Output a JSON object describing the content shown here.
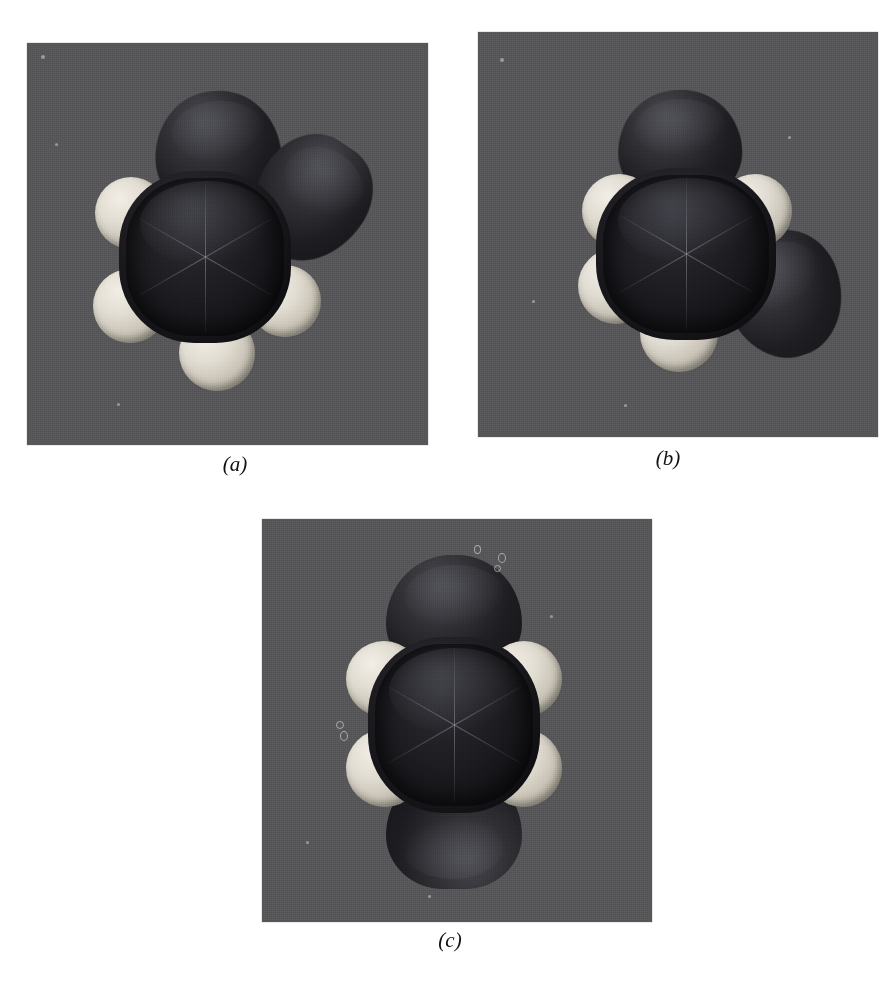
{
  "figure": {
    "type": "photographic-figure",
    "page_background": "#ffffff",
    "panel_background": "#57575a",
    "panel_count": 3,
    "panels": [
      {
        "id": "a",
        "caption": "(a)",
        "orbital_lobes": 2,
        "lobe_positions": [
          "top",
          "upper-right"
        ],
        "hydrogen_spheres": 4,
        "hydrogen_positions": [
          "upper-left",
          "lower-left",
          "bottom",
          "lower-right"
        ],
        "core": "hexagonal carbon ring"
      },
      {
        "id": "b",
        "caption": "(b)",
        "orbital_lobes": 2,
        "lobe_positions": [
          "top",
          "lower-right"
        ],
        "hydrogen_spheres": 4,
        "hydrogen_positions": [
          "upper-left",
          "upper-right",
          "lower-left",
          "bottom"
        ],
        "core": "hexagonal carbon ring"
      },
      {
        "id": "c",
        "caption": "(c)",
        "orbital_lobes": 2,
        "lobe_positions": [
          "top",
          "bottom"
        ],
        "hydrogen_spheres": 4,
        "hydrogen_positions": [
          "upper-left",
          "upper-right",
          "lower-left",
          "lower-right"
        ],
        "core": "hexagonal carbon ring"
      }
    ],
    "colors": {
      "panel_gray": "#57575a",
      "lobe_dark": "#25252a",
      "carbon_core": "#141418",
      "hydrogen_light": "#e2ddd2",
      "caption_text": "#111111"
    }
  }
}
